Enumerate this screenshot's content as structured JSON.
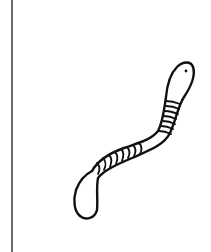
{
  "image": {
    "subject": "worm line drawing",
    "background_color": "#ffffff",
    "line_color": "#111111",
    "border_color": "#6b6b6b"
  }
}
